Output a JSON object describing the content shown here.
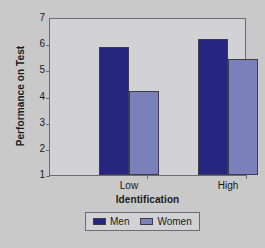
{
  "chart_data": {
    "type": "bar",
    "title": "",
    "xlabel": "Identification",
    "ylabel": "Performance on Test",
    "categories": [
      "Low",
      "High"
    ],
    "series": [
      {
        "name": "Men",
        "values": [
          5.9,
          6.2
        ],
        "color": "#262680"
      },
      {
        "name": "Women",
        "values": [
          4.2,
          5.45
        ],
        "color": "#7b7fba"
      }
    ],
    "ylim": [
      1,
      7
    ],
    "yticks": [
      1,
      2,
      3,
      4,
      5,
      6,
      7
    ],
    "ytick_labels": [
      "1",
      "2",
      "3",
      "4",
      "5",
      "6",
      "7"
    ],
    "grid": false,
    "legend_position": "bottom",
    "legend_entries": [
      "Men",
      "Women"
    ]
  },
  "figure": {
    "background_color": "#c9c9c9",
    "plot_background_color": "#d2d2d4",
    "axis_color": "#6c6c70",
    "bar_border_color": "#3c3c50"
  }
}
